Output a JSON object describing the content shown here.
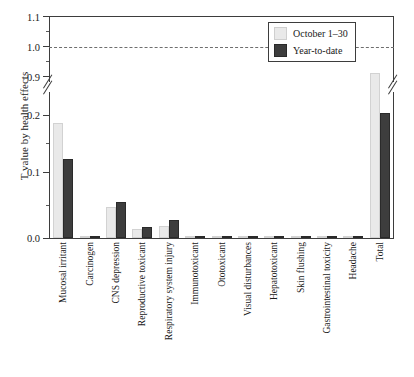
{
  "chart_data": {
    "type": "bar",
    "title": "",
    "xlabel": "",
    "ylabel": "T value by health effects",
    "ylim": [
      0.0,
      1.1
    ],
    "axis_break": {
      "lower": 0.22,
      "upper": 0.9,
      "note": "y-axis broken between 0.2-range and 0.9"
    },
    "yticks_lower": [
      "0.0",
      "0.1",
      "0.2"
    ],
    "yticks_upper": [
      "0.9",
      "1.0",
      "1.1"
    ],
    "grid": false,
    "reference_line": {
      "value": 1.0,
      "style": "dashed"
    },
    "legend_position": "top-right",
    "categories": [
      "Mucosal irritant",
      "Carcinogen",
      "CNS depression",
      "Reproductive toxicant",
      "Respiratory system injury",
      "Immunotoxicant",
      "Ototoxicant",
      "Visual disturbances",
      "Hepatotoxicant",
      "Skin flushing",
      "Gastrointestinal toxicity",
      "Headache",
      "Total"
    ],
    "series": [
      {
        "name": "October 1–30",
        "color": "#e9e9e9",
        "values": [
          0.187,
          0.0,
          0.051,
          0.015,
          0.02,
          0.001,
          0.0005,
          0.002,
          0.0008,
          0.0004,
          0.0005,
          0.001,
          0.268
        ]
      },
      {
        "name": "Year-to-date",
        "color": "#3d3d3d",
        "values": [
          0.129,
          0.0,
          0.058,
          0.018,
          0.03,
          0.002,
          0.001,
          0.003,
          0.002,
          0.001,
          0.001,
          0.004,
          0.204
        ]
      }
    ]
  },
  "legend": {
    "items": [
      {
        "label": "October 1–30",
        "color": "#e9e9e9"
      },
      {
        "label": "Year-to-date",
        "color": "#3d3d3d"
      }
    ]
  },
  "axis": {
    "y_label": "T value by health effects",
    "y_ticks": [
      {
        "label": "1.1",
        "top": 12
      },
      {
        "label": "1.0",
        "top": 42
      },
      {
        "label": "0.9",
        "top": 72
      },
      {
        "label": "0.2",
        "top": 110
      },
      {
        "label": "0.1",
        "top": 167
      },
      {
        "label": "0.0",
        "top": 233
      }
    ]
  }
}
